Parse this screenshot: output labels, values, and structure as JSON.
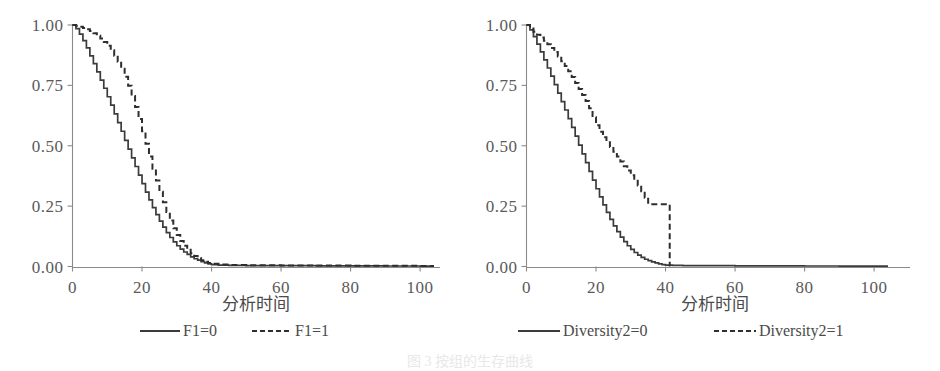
{
  "figure": {
    "caption": "图 3  按组的生存曲线",
    "panels": [
      {
        "id": "left",
        "xlabel": "分析时间",
        "ylabel": "",
        "xticks": [
          "0",
          "20",
          "40",
          "60",
          "80",
          "100"
        ],
        "yticks": [
          "0.00",
          "0.25",
          "0.50",
          "0.75",
          "1.00"
        ],
        "legend": [
          {
            "label": "F1=0",
            "style": "solid"
          },
          {
            "label": "F1=1",
            "style": "dashed"
          }
        ]
      },
      {
        "id": "right",
        "xlabel": "分析时间",
        "ylabel": "",
        "xticks": [
          "0",
          "20",
          "40",
          "60",
          "80",
          "100"
        ],
        "yticks": [
          "0.00",
          "0.25",
          "0.50",
          "0.75",
          "1.00"
        ],
        "legend": [
          {
            "label": "Diversity2=0",
            "style": "solid"
          },
          {
            "label": "Diversity2=1",
            "style": "dashed"
          }
        ]
      }
    ]
  },
  "colors": {
    "curve": "#3b3b3b",
    "axis": "#8a8a8a",
    "text": "#5a5a5a",
    "background": "#ffffff"
  },
  "chart_data": [
    {
      "type": "line",
      "subtype": "kaplan-meier-step",
      "panel": "left",
      "title": "",
      "xlabel": "分析时间",
      "ylabel": "",
      "xlim": [
        0,
        104
      ],
      "ylim": [
        0,
        1.0
      ],
      "xticks": [
        0,
        20,
        40,
        60,
        80,
        100
      ],
      "yticks": [
        0.0,
        0.25,
        0.5,
        0.75,
        1.0
      ],
      "grid": false,
      "legend_position": "bottom",
      "series": [
        {
          "name": "F1=0",
          "style": "solid",
          "x": [
            0,
            1,
            2,
            3,
            4,
            5,
            6,
            7,
            8,
            9,
            10,
            11,
            12,
            13,
            14,
            15,
            16,
            17,
            18,
            19,
            20,
            21,
            22,
            23,
            24,
            25,
            26,
            27,
            28,
            29,
            30,
            31,
            32,
            33,
            34,
            35,
            36,
            37,
            38,
            39,
            40,
            42,
            45,
            50,
            60,
            70,
            80,
            90,
            100,
            104
          ],
          "y": [
            1.0,
            0.985,
            0.962,
            0.935,
            0.905,
            0.872,
            0.84,
            0.806,
            0.772,
            0.738,
            0.703,
            0.668,
            0.632,
            0.596,
            0.56,
            0.522,
            0.486,
            0.45,
            0.414,
            0.378,
            0.343,
            0.308,
            0.276,
            0.244,
            0.215,
            0.188,
            0.163,
            0.14,
            0.12,
            0.102,
            0.086,
            0.072,
            0.06,
            0.05,
            0.04,
            0.032,
            0.026,
            0.02,
            0.015,
            0.011,
            0.008,
            0.006,
            0.005,
            0.004,
            0.0035,
            0.003,
            0.0025,
            0.002,
            0.0015,
            0.0015
          ]
        },
        {
          "name": "F1=1",
          "style": "dashed",
          "x": [
            0,
            1,
            2,
            3,
            4,
            5,
            6,
            7,
            8,
            9,
            10,
            11,
            12,
            13,
            14,
            15,
            16,
            17,
            18,
            19,
            20,
            21,
            22,
            23,
            24,
            25,
            26,
            27,
            28,
            29,
            30,
            31,
            32,
            33,
            34,
            35,
            36,
            37,
            38,
            39,
            40,
            42,
            45,
            50,
            60,
            70,
            80,
            90,
            100,
            104
          ],
          "y": [
            1.0,
            0.997,
            0.993,
            0.988,
            0.982,
            0.975,
            0.966,
            0.956,
            0.944,
            0.93,
            0.914,
            0.895,
            0.873,
            0.848,
            0.819,
            0.786,
            0.748,
            0.706,
            0.66,
            0.611,
            0.56,
            0.508,
            0.456,
            0.405,
            0.356,
            0.31,
            0.266,
            0.226,
            0.19,
            0.158,
            0.13,
            0.106,
            0.086,
            0.069,
            0.055,
            0.043,
            0.034,
            0.026,
            0.02,
            0.015,
            0.011,
            0.008,
            0.006,
            0.005,
            0.0045,
            0.004,
            0.0035,
            0.003,
            0.0025,
            0.0025
          ]
        }
      ]
    },
    {
      "type": "line",
      "subtype": "kaplan-meier-step",
      "panel": "right",
      "title": "",
      "xlabel": "分析时间",
      "ylabel": "",
      "xlim": [
        0,
        104
      ],
      "ylim": [
        0,
        1.0
      ],
      "xticks": [
        0,
        20,
        40,
        60,
        80,
        100
      ],
      "yticks": [
        0.0,
        0.25,
        0.5,
        0.75,
        1.0
      ],
      "grid": false,
      "legend_position": "bottom",
      "series": [
        {
          "name": "Diversity2=0",
          "style": "solid",
          "x": [
            0,
            1,
            2,
            3,
            4,
            5,
            6,
            7,
            8,
            9,
            10,
            11,
            12,
            13,
            14,
            15,
            16,
            17,
            18,
            19,
            20,
            21,
            22,
            23,
            24,
            25,
            26,
            27,
            28,
            29,
            30,
            31,
            32,
            33,
            34,
            35,
            36,
            37,
            38,
            39,
            40,
            42,
            45,
            50,
            60,
            70,
            80,
            90,
            100,
            104
          ],
          "y": [
            1.0,
            0.98,
            0.952,
            0.921,
            0.889,
            0.856,
            0.822,
            0.788,
            0.753,
            0.718,
            0.683,
            0.648,
            0.612,
            0.576,
            0.54,
            0.503,
            0.466,
            0.43,
            0.394,
            0.358,
            0.322,
            0.288,
            0.255,
            0.224,
            0.195,
            0.168,
            0.144,
            0.122,
            0.103,
            0.086,
            0.071,
            0.058,
            0.047,
            0.038,
            0.03,
            0.024,
            0.019,
            0.015,
            0.011,
            0.008,
            0.006,
            0.005,
            0.004,
            0.0035,
            0.003,
            0.0025,
            0.002,
            0.0018,
            0.0015,
            0.0015
          ]
        },
        {
          "name": "Diversity2=1",
          "style": "dashed",
          "x": [
            0,
            1,
            2,
            3,
            4,
            5,
            6,
            7,
            8,
            9,
            10,
            11,
            12,
            13,
            14,
            15,
            16,
            17,
            18,
            19,
            20,
            21,
            22,
            23,
            24,
            25,
            26,
            27,
            28,
            29,
            30,
            31,
            32,
            33,
            34,
            35,
            36,
            37,
            38,
            39,
            40,
            41,
            41.2
          ],
          "y": [
            1.0,
            0.985,
            0.972,
            0.96,
            0.948,
            0.935,
            0.92,
            0.905,
            0.888,
            0.87,
            0.85,
            0.83,
            0.808,
            0.785,
            0.76,
            0.735,
            0.71,
            0.685,
            0.655,
            0.618,
            0.585,
            0.558,
            0.535,
            0.515,
            0.495,
            0.475,
            0.455,
            0.435,
            0.415,
            0.398,
            0.378,
            0.355,
            0.335,
            0.312,
            0.285,
            0.258,
            0.258,
            0.258,
            0.258,
            0.258,
            0.258,
            0.258,
            0.0
          ]
        }
      ]
    }
  ]
}
